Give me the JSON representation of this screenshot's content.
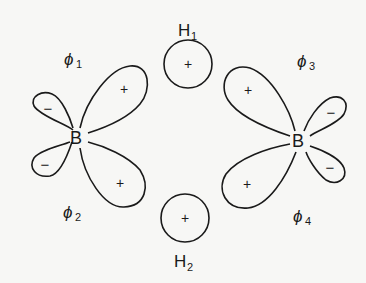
{
  "diagram": {
    "type": "orbital-overlap-diagram",
    "hydrogens": [
      {
        "label": "H",
        "subscript": "1",
        "sign": "+"
      },
      {
        "label": "H",
        "subscript": "2",
        "sign": "+"
      }
    ],
    "borons": [
      {
        "label": "B"
      },
      {
        "label": "B"
      }
    ],
    "hybrid_orbitals": [
      {
        "label": "ϕ",
        "subscript": "1",
        "large_lobe_sign": "+",
        "small_lobe_sign": "−"
      },
      {
        "label": "ϕ",
        "subscript": "2",
        "large_lobe_sign": "+",
        "small_lobe_sign": "−"
      },
      {
        "label": "ϕ",
        "subscript": "3",
        "large_lobe_sign": "+",
        "small_lobe_sign": "−"
      },
      {
        "label": "ϕ",
        "subscript": "4",
        "large_lobe_sign": "+",
        "small_lobe_sign": "−"
      }
    ]
  }
}
